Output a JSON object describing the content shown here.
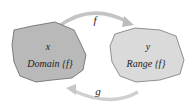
{
  "diagram": {
    "domain": {
      "var": "x",
      "label": "Domain {f}",
      "fill": "#b9b9b9"
    },
    "range": {
      "var": "y",
      "label": "Range {f}",
      "fill": "#dadada"
    },
    "arrow_top": {
      "label": "f",
      "color": "#c8c8c8"
    },
    "arrow_bottom": {
      "label": "g",
      "color": "#d4d4d4"
    }
  }
}
